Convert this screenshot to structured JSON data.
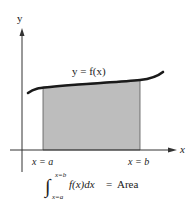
{
  "diagram": {
    "y_axis_label": "y",
    "x_axis_label": "x",
    "curve_label": "y = f(x)",
    "left_bound_label": "x = a",
    "right_bound_label": "x = b",
    "integral": {
      "symbol": "∫",
      "upper_limit": "x=b",
      "lower_limit": "x=a",
      "integrand": "f(x)dx",
      "equals": "=",
      "result": "Area"
    },
    "colors": {
      "shaded_region": "#bdbdbd",
      "curve": "#1a1a1a",
      "axes": "#333333",
      "background": "#ffffff"
    }
  }
}
